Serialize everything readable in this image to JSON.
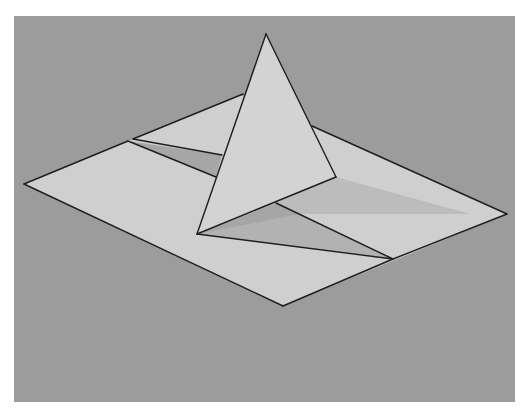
{
  "canvas": {
    "width": 532,
    "height": 416,
    "background": "#ffffff"
  },
  "colors": {
    "panel": "#9c9c9c",
    "plane": "#cfcfcf",
    "pyramid_face": "#d3d3d3",
    "shadow_dark": "#a6a6a6",
    "shadow_mid": "#b2b2b2",
    "shadow_light": "#bcbcbc",
    "stroke": "#1e1e1e"
  },
  "figure": {
    "panel": {
      "x": 14,
      "y": 16,
      "width": 501,
      "height": 386
    },
    "plane_polygon": "24,184 128,141 133,139 240,95 312,126 507,214 283,306",
    "upper_flap_shadow": "128,141 222,155 216,177",
    "cast_shadow_light": "336,177 470,214 300,214 276,203",
    "crease_shadow_dark": "197,234 276,203 393,259",
    "crease_shadow_mid": "197,234 300,214 393,259",
    "pyramid_face": "266,34 197,234 336,177",
    "edges": [
      "24,184 128,141",
      "133,139 243,94",
      "312,126 507,214",
      "507,214 393,259",
      "393,259 283,306",
      "283,306 24,184",
      "128,141 216,177",
      "133,139 222,155",
      "197,234 393,259",
      "276,203 393,259",
      "266,34 197,234",
      "266,34 336,177",
      "197,234 336,177"
    ]
  }
}
